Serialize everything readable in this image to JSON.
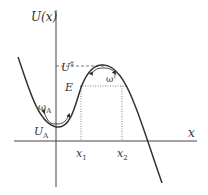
{
  "diagram": {
    "colors": {
      "axis": "#444444",
      "curve": "#333333",
      "guide": "#666666",
      "text": "#333333"
    },
    "axes": {
      "y_label": "U(x)",
      "x_label": "x"
    },
    "labels": {
      "barrier_energy": "U",
      "barrier_energy_sup": "‡",
      "energy_level": "E",
      "well_energy": "U",
      "well_energy_sub": "A",
      "well_frequency": "ω",
      "well_frequency_sub": "A",
      "barrier_frequency": "ω",
      "barrier_frequency_sup": "‡",
      "turning_point_1": "x",
      "turning_point_1_sub": "1",
      "turning_point_2": "x",
      "turning_point_2_sub": "2"
    }
  }
}
